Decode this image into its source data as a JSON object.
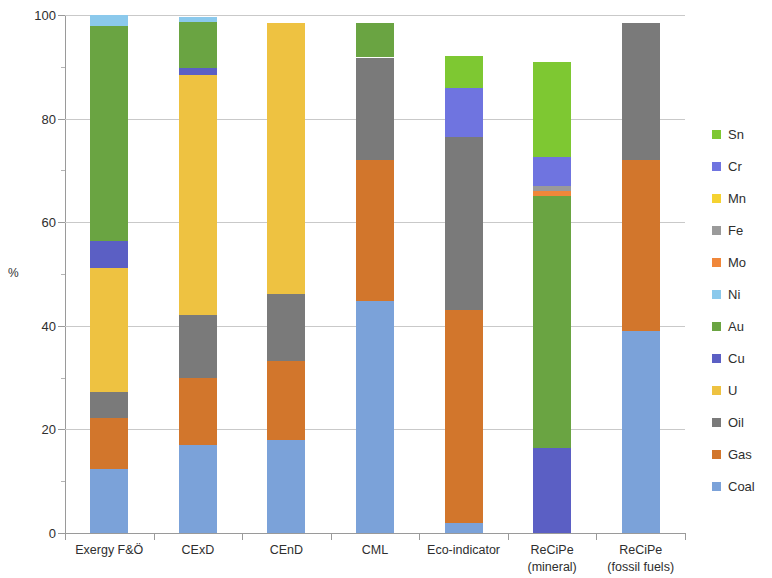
{
  "chart_data": {
    "type": "bar",
    "subtype": "stacked-column-100",
    "title": "",
    "xlabel": "",
    "ylabel": "%",
    "ylim": [
      0,
      100
    ],
    "yticks": [
      0,
      20,
      40,
      60,
      80,
      100
    ],
    "ytick_labels": [
      "0",
      "20",
      "40",
      "60",
      "80",
      "100"
    ],
    "grid": "horizontal",
    "legend_position": "right",
    "categories": [
      "Exergy F&Ö",
      "CExD",
      "CEnD",
      "CML",
      "Eco-indicator",
      "ReCiPe\n(mineral)",
      "ReCiPe\n(fossil fuels)"
    ],
    "series": [
      {
        "name": "Coal",
        "color": "#7ba2d9",
        "values": [
          12.4,
          17.0,
          18.0,
          44.8,
          2.0,
          0.0,
          39.0
        ]
      },
      {
        "name": "Gas",
        "color": "#d2762c",
        "values": [
          9.9,
          13.0,
          15.2,
          27.3,
          41.0,
          0.0,
          33.0
        ]
      },
      {
        "name": "Oil",
        "color": "#7a7a7a",
        "values": [
          5.0,
          12.0,
          13.0,
          19.7,
          33.5,
          0.0,
          26.5
        ]
      },
      {
        "name": "U",
        "color": "#eec241",
        "values": [
          23.9,
          46.5,
          52.3,
          0.0,
          0.0,
          0.0,
          0.0
        ]
      },
      {
        "name": "Cu",
        "color": "#5b5fc4",
        "values": [
          5.1,
          1.2,
          0.0,
          0.0,
          0.0,
          16.5,
          0.0
        ]
      },
      {
        "name": "Au",
        "color": "#6aa442",
        "values": [
          41.5,
          9.0,
          0.0,
          6.7,
          0.0,
          48.5,
          0.0
        ]
      },
      {
        "name": "Ni",
        "color": "#8bc9ec",
        "values": [
          2.2,
          1.0,
          0.0,
          0.0,
          0.0,
          0.0,
          0.0
        ]
      },
      {
        "name": "Mo",
        "color": "#f0873a",
        "values": [
          0.0,
          0.0,
          0.0,
          0.0,
          0.0,
          1.0,
          0.0
        ]
      },
      {
        "name": "Fe",
        "color": "#9a9a9a",
        "values": [
          0.0,
          0.0,
          0.0,
          0.0,
          0.0,
          1.0,
          0.0
        ]
      },
      {
        "name": "Mn",
        "color": "#f5d231",
        "values": [
          0.0,
          0.0,
          0.0,
          0.0,
          0.0,
          0.0,
          0.0
        ]
      },
      {
        "name": "Cr",
        "color": "#6f74e0",
        "values": [
          0.0,
          0.0,
          0.0,
          0.0,
          9.5,
          5.5,
          0.0
        ]
      },
      {
        "name": "Sn",
        "color": "#7ec832",
        "values": [
          0.0,
          0.0,
          0.0,
          0.0,
          6.0,
          18.5,
          0.0
        ]
      }
    ],
    "stack_order_bottom_to_top": [
      "Coal",
      "Gas",
      "Oil",
      "U",
      "Cu",
      "Au",
      "Ni",
      "Mo",
      "Fe",
      "Mn",
      "Cr",
      "Sn"
    ],
    "legend_order_top_to_bottom": [
      "Sn",
      "Cr",
      "Mn",
      "Fe",
      "Mo",
      "Ni",
      "Au",
      "Cu",
      "U",
      "Oil",
      "Gas",
      "Coal"
    ],
    "annotations": []
  },
  "legend": {
    "items": [
      {
        "label": "Sn",
        "color": "#7ec832"
      },
      {
        "label": "Cr",
        "color": "#6f74e0"
      },
      {
        "label": "Mn",
        "color": "#f5d231"
      },
      {
        "label": "Fe",
        "color": "#9a9a9a"
      },
      {
        "label": "Mo",
        "color": "#f0873a"
      },
      {
        "label": "Ni",
        "color": "#8bc9ec"
      },
      {
        "label": "Au",
        "color": "#6aa442"
      },
      {
        "label": "Cu",
        "color": "#5b5fc4"
      },
      {
        "label": "U",
        "color": "#eec241"
      },
      {
        "label": "Oil",
        "color": "#7a7a7a"
      },
      {
        "label": "Gas",
        "color": "#d2762c"
      },
      {
        "label": "Coal",
        "color": "#7ba2d9"
      }
    ]
  }
}
